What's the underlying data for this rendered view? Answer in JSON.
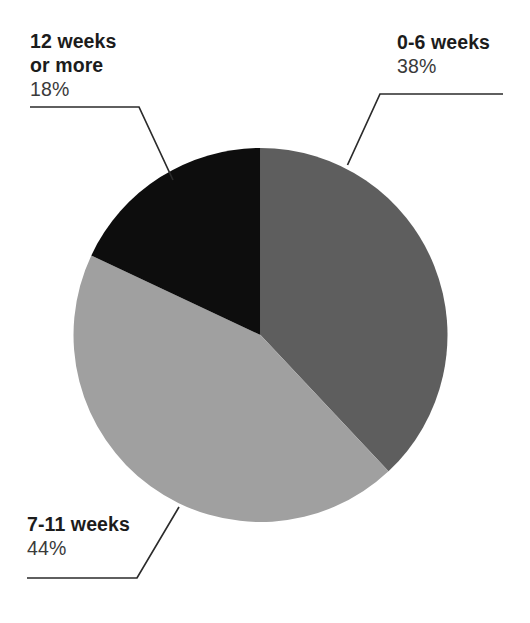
{
  "chart_data": {
    "type": "pie",
    "title": "",
    "subtitle": "",
    "xlabel": "",
    "ylabel": "",
    "grid": false,
    "legend_position": "none",
    "label_style": "leader-line callouts outside slices",
    "start_angle_deg": 0,
    "direction": "clockwise",
    "categories": [
      "0-6 weeks",
      "7-11 weeks",
      "12 weeks or more"
    ],
    "values": [
      38,
      44,
      18
    ],
    "value_unit": "%",
    "colors": [
      "#5e5e5e",
      "#a0a0a0",
      "#0d0d0d"
    ],
    "slices": [
      {
        "label": "0-6 weeks",
        "label_line1": "0-6 weeks",
        "label_line2": "",
        "value": 38,
        "value_label": "38%",
        "color": "#5e5e5e",
        "color_name": "dark-gray",
        "start_angle_deg": 0,
        "end_angle_deg": 136.8
      },
      {
        "label": "7-11 weeks",
        "label_line1": "7-11 weeks",
        "label_line2": "",
        "value": 44,
        "value_label": "44%",
        "color": "#a0a0a0",
        "color_name": "light-gray",
        "start_angle_deg": 136.8,
        "end_angle_deg": 295.2
      },
      {
        "label": "12 weeks or more",
        "label_line1": "12 weeks",
        "label_line2": "or more",
        "value": 18,
        "value_label": "18%",
        "color": "#0d0d0d",
        "color_name": "black",
        "start_angle_deg": 295.2,
        "end_angle_deg": 360
      }
    ]
  },
  "callouts": {
    "top_right": {
      "line1": "0-6 weeks",
      "line2": "",
      "percent": "38%"
    },
    "top_left": {
      "line1": "12 weeks",
      "line2": "or more",
      "percent": "18%"
    },
    "bottom_left": {
      "line1": "7-11 weeks",
      "line2": "",
      "percent": "44%"
    }
  },
  "style": {
    "background": "#ffffff",
    "leader_line_color": "#2b2b2b",
    "text_color": "#1c1c1c",
    "percent_color": "#3a3a3a"
  }
}
